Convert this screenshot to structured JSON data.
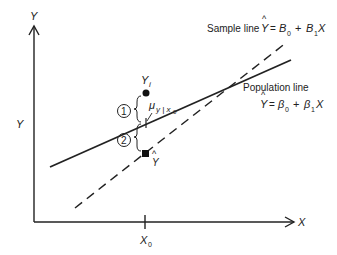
{
  "axes": {
    "y_label_top": "Y",
    "y_label_side": "Y",
    "x_label": "X",
    "x0_label": "X",
    "x0_sub": "0"
  },
  "sample_line": {
    "label": "Sample line",
    "eq_y": "Y",
    "eq_hat": "^",
    "eq_eq": "=",
    "eq_b0": "B",
    "eq_b0_sub": "0",
    "eq_plus": "+",
    "eq_b1": "B",
    "eq_b1_sub": "1",
    "eq_x": "X"
  },
  "population_line": {
    "label": "Population line",
    "eq_y": "Y",
    "eq_hat": "^",
    "eq_eq": "=",
    "eq_b0": "β",
    "eq_b0_sub": "0",
    "eq_plus": "+",
    "eq_b1": "β",
    "eq_b1_sub": "1",
    "eq_x": "X"
  },
  "points": {
    "yi_label": "Y",
    "yi_sub": "i",
    "mu_label": "μ",
    "mu_sub": "y | x",
    "mu_sub2": "0",
    "yhat_label": "Y",
    "yhat_hat": "^"
  },
  "circles": {
    "one": "1",
    "two": "2"
  },
  "colors": {
    "ink": "#222222",
    "background": "#ffffff"
  }
}
